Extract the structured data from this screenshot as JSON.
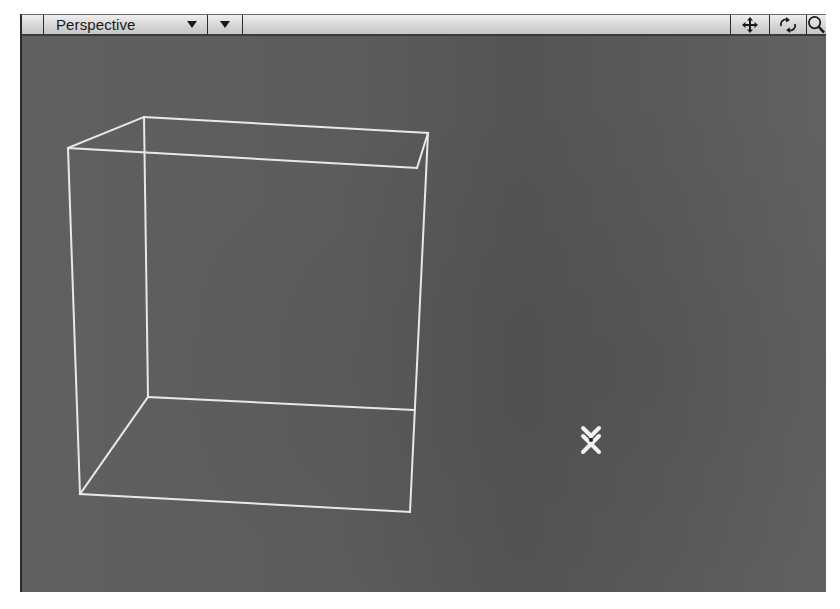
{
  "viewport": {
    "view_mode": "Perspective",
    "header_buttons": [
      {
        "name": "move-icon",
        "tooltip_role": "pan"
      },
      {
        "name": "rotate-icon",
        "tooltip_role": "rotate"
      },
      {
        "name": "zoom-icon",
        "tooltip_role": "zoom"
      }
    ],
    "colors": {
      "background": "#5a5a5a",
      "wireframe": "#e8e8e8",
      "header": "#d4d4d4"
    },
    "cube_wireframe": {
      "vertices": {
        "back_top_left": [
          122,
          81
        ],
        "back_top_right": [
          406,
          97
        ],
        "front_top_left": [
          46,
          112
        ],
        "front_top_right": [
          395,
          132
        ],
        "back_bottom_left": [
          126,
          361
        ],
        "back_bottom_right": [
          391,
          374
        ],
        "front_bottom_left": [
          58,
          458
        ],
        "front_bottom_right": [
          388,
          476
        ]
      }
    },
    "cursor": {
      "type": "x-crosshair",
      "x": 573,
      "y": 404
    }
  }
}
